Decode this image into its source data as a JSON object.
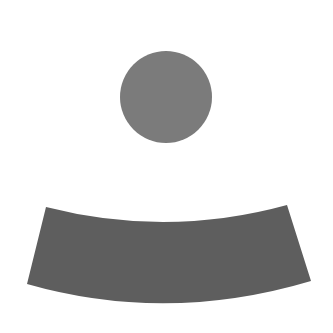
{
  "figure": {
    "head": {
      "shape": "circle",
      "color": "#7b7b7b"
    },
    "band": {
      "shape": "curved-band",
      "color": "#5e5e5e"
    },
    "background": "#ffffff"
  }
}
